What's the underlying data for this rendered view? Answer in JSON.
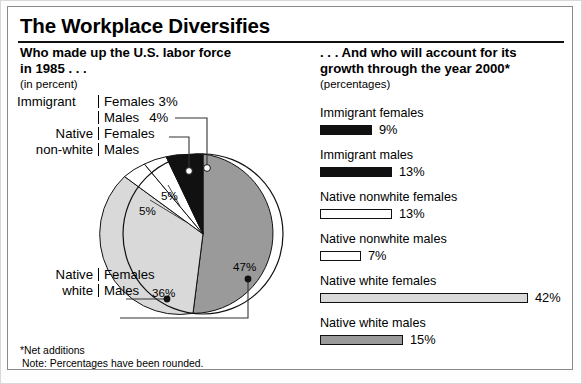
{
  "title": "The Workplace Diversifies",
  "left": {
    "heading": "Who made up the U.S. labor force in 1985 . . .",
    "heading_line1": "Who made up the U.S. labor force",
    "heading_line2": "in 1985 . . .",
    "subheading": "(in percent)",
    "legend": {
      "immigrant": {
        "group": "Immigrant",
        "females_label": "Females",
        "females_value": "3%",
        "males_label": "Males",
        "males_value": "4%"
      },
      "native_nonwhite": {
        "group_line1": "Native",
        "group_line2": "non-white",
        "females_label": "Females",
        "males_label": "Males"
      },
      "native_white": {
        "group_line1": "Native",
        "group_line2": "white",
        "females_label": "Females",
        "males_label": "Males"
      }
    },
    "slice_labels": {
      "nnw_females": "5%",
      "nnw_males": "5%",
      "nw_females": "36%",
      "nw_males": "47%"
    }
  },
  "right": {
    "heading_line1": ". . . And who will account for its",
    "heading_line2": "growth through the year 2000*",
    "subheading": "(percentages)"
  },
  "footnotes": {
    "line1": "*Net additions",
    "line2": "Note:  Percentages have been rounded."
  },
  "colors": {
    "black": "#111111",
    "white": "#ffffff",
    "light_gray": "#d9d9d9",
    "mid_gray": "#9a9a9a",
    "outline": "#111111"
  },
  "chart_data": [
    {
      "type": "pie",
      "title": "Who made up the U.S. labor force in 1985 . . .",
      "subtitle": "(in percent)",
      "unit": "percent",
      "categories": [
        "Native white males",
        "Native white females",
        "Native non-white females",
        "Native non-white males",
        "Immigrant females",
        "Immigrant males"
      ],
      "values": [
        47,
        36,
        5,
        5,
        3,
        4
      ],
      "labels": [
        "47%",
        "36%",
        "5%",
        "5%",
        "3%",
        "4%"
      ],
      "colors": [
        "#9a9a9a",
        "#d9d9d9",
        "#ffffff",
        "#ffffff",
        "#111111",
        "#111111"
      ],
      "start_angle_deg": 0,
      "direction": "clockwise",
      "legend": "left-callouts"
    },
    {
      "type": "bar",
      "orientation": "horizontal",
      "title": ". . . And who will account for its growth through the year 2000*",
      "subtitle": "(percentages)",
      "unit": "percentages",
      "categories": [
        "Immigrant females",
        "Immigrant males",
        "Native nonwhite females",
        "Native nonwhite males",
        "Native white females",
        "Native white males"
      ],
      "values": [
        9,
        13,
        13,
        7,
        42,
        15
      ],
      "labels": [
        "9%",
        "13%",
        "13%",
        "7%",
        "42%",
        "15%"
      ],
      "colors": [
        "#111111",
        "#111111",
        "#ffffff",
        "#ffffff",
        "#d9d9d9",
        "#9a9a9a"
      ],
      "xlim": [
        0,
        42
      ],
      "grid": false,
      "legend": "none"
    }
  ],
  "bars": [
    {
      "label": "Immigrant females",
      "value": 9,
      "display": "9%",
      "fill": "fill-black",
      "width": 52
    },
    {
      "label": "Immigrant males",
      "value": 13,
      "display": "13%",
      "fill": "fill-black",
      "width": 72
    },
    {
      "label": "Native nonwhite females",
      "value": 13,
      "display": "13%",
      "fill": "fill-white",
      "width": 72
    },
    {
      "label": "Native nonwhite males",
      "value": 7,
      "display": "7%",
      "fill": "fill-white",
      "width": 41
    },
    {
      "label": "Native white females",
      "value": 42,
      "display": "42%",
      "fill": "fill-lgray",
      "width": 208
    },
    {
      "label": "Native white males",
      "value": 15,
      "display": "15%",
      "fill": "fill-mgray",
      "width": 83
    }
  ]
}
